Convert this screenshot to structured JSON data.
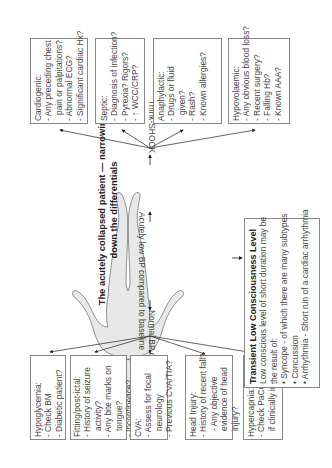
{
  "title": {
    "line1": "The acutely collapsed patient — narrowing",
    "line2": "down the differentials"
  },
  "labels": {
    "low_bp": "Acutely low BP compared to baseline",
    "think_shock": "Think-SHOCK",
    "normal_bp": "Normal BP compared to baseline"
  },
  "shock_boxes": [
    {
      "title": "Cardiogenic:",
      "items": [
        "- Any preceding chest",
        "  pain or palpitations?",
        "- Abnormal ECG?",
        "- Significant cardiac Hx?"
      ]
    },
    {
      "title": "Septic:",
      "items": [
        "- Diagnosis of infection?",
        "- Pyrexia? Rigors?",
        "- ↑ WCC/CRP?"
      ]
    },
    {
      "title": "Anaphylactic:",
      "items": [
        "- Drugs or fluid",
        "  given?",
        "- Rash?",
        "- Known allergies?"
      ]
    },
    {
      "title": "Hypovolaemic:",
      "items": [
        "- Any obvious blood loss?",
        "- Recent surgery?",
        "- Falling Hb?",
        "- Known AAA?"
      ]
    }
  ],
  "normal_boxes": [
    {
      "title": "Hypoglycemia:",
      "items": [
        "- Check BM",
        "- Diabetic patient?"
      ]
    },
    {
      "title": "Fitting/post-ictal:",
      "items": [
        "- History of seizure",
        "  activity?",
        "- Any bite marks on",
        "  tongue?",
        "- Incontinence?"
      ]
    },
    {
      "title": "CVA:",
      "items": [
        "- Assess for focal",
        "  neurology",
        "- Previous CVA/TIA?"
      ]
    },
    {
      "title": "Head Injury:",
      "items": [
        "- History of recent fall?",
        "- Any objective",
        "  evidence of head",
        "  injury?"
      ]
    },
    {
      "title": "Hypercapnia:",
      "items": [
        "- Check PaCO2",
        "  if clinically indicated"
      ]
    }
  ],
  "transient": {
    "title": "Transient Low Consciousness Level",
    "intro1": "Low conscious level of short duration may be",
    "intro2": "the result of:",
    "items": [
      "• Syncope - of which there are many subtypes",
      "• Concussion",
      "• Arrhythmia - Short run of a cardiac arrhythmia"
    ]
  }
}
